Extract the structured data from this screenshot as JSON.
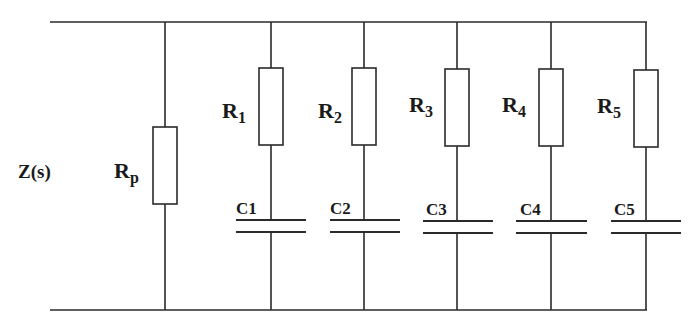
{
  "diagram": {
    "type": "circuit",
    "impedance_label": "Z(s)",
    "colors": {
      "line": "#2a2a2a",
      "background": "#ffffff"
    },
    "parallel_resistor": {
      "label_main": "R",
      "label_sub": "p"
    },
    "branches": [
      {
        "r_main": "R",
        "r_sub": "1",
        "c_label": "C1"
      },
      {
        "r_main": "R",
        "r_sub": "2",
        "c_label": "C2"
      },
      {
        "r_main": "R",
        "r_sub": "3",
        "c_label": "C3"
      },
      {
        "r_main": "R",
        "r_sub": "4",
        "c_label": "C4"
      },
      {
        "r_main": "R",
        "r_sub": "5",
        "c_label": "C5"
      }
    ]
  }
}
